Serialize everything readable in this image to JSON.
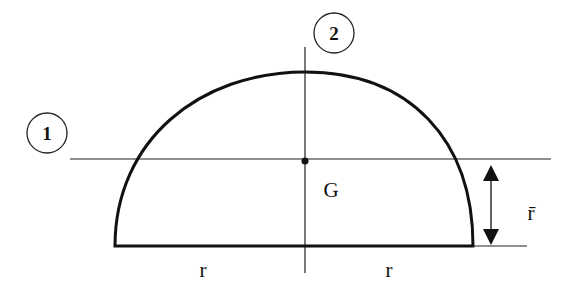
{
  "diagram": {
    "axis1_label": "1",
    "axis2_label": "2",
    "centroid_label": "G",
    "left_radius_label": "r",
    "right_radius_label": "r",
    "centroid_distance_label": "r̄",
    "colors": {
      "stroke": "#111111",
      "background": "#ffffff"
    }
  }
}
